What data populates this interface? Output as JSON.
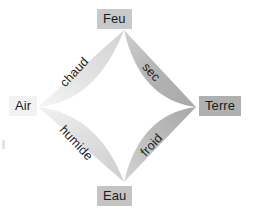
{
  "diagram": {
    "type": "four-elements-diamond",
    "background_color": "#ffffff",
    "nodes": [
      {
        "id": "feu",
        "label": "Feu",
        "position": "top",
        "box_color": "#c9c9c9",
        "text_color": "#1a1a1a"
      },
      {
        "id": "terre",
        "label": "Terre",
        "position": "right",
        "box_color": "#b0b0b0",
        "text_color": "#1a1a1a"
      },
      {
        "id": "eau",
        "label": "Eau",
        "position": "bottom",
        "box_color": "#c4c4c4",
        "text_color": "#1a1a1a"
      },
      {
        "id": "air",
        "label": "Air",
        "position": "left",
        "box_color": "#f2f2f2",
        "text_color": "#1a1a1a"
      }
    ],
    "qualities": [
      {
        "id": "chaud",
        "label": "chaud",
        "between": "air-feu",
        "quadrant": "top-left",
        "band_color": "#e6e6e6",
        "rotation_deg": -47
      },
      {
        "id": "sec",
        "label": "sec",
        "between": "feu-terre",
        "quadrant": "top-right",
        "band_color": "#b5b5b5",
        "rotation_deg": 47
      },
      {
        "id": "froid",
        "label": "froid",
        "between": "terre-eau",
        "quadrant": "bottom-right",
        "band_color": "#b8b8b8",
        "rotation_deg": -47
      },
      {
        "id": "humide",
        "label": "humide",
        "between": "eau-air",
        "quadrant": "bottom-left",
        "band_color": "#dcdcdc",
        "rotation_deg": 47
      }
    ],
    "vertices": {
      "top": "124,30",
      "right": "196,107",
      "bottom": "124,182",
      "left": "38,107"
    }
  }
}
